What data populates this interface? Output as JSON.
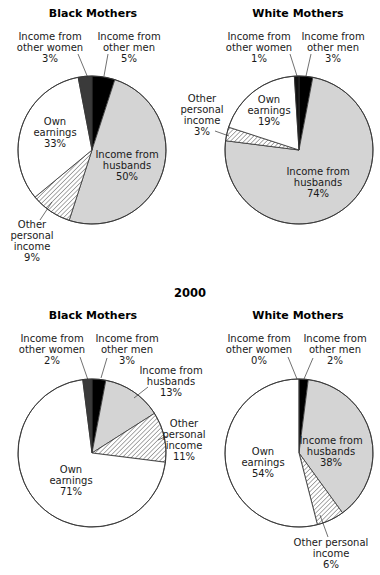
{
  "chart_data": [
    {
      "type": "pie",
      "group": "",
      "title": "Black Mothers",
      "slices": [
        {
          "label": "Income from other men",
          "value": 5,
          "display": "5%",
          "fill": "#000000"
        },
        {
          "label": "Income from husbands",
          "value": 50,
          "display": "50%",
          "fill": "#d4d4d4"
        },
        {
          "label": "Other personal income",
          "value": 9,
          "display": "9%",
          "fill": "hatch"
        },
        {
          "label": "Own earnings",
          "value": 33,
          "display": "33%",
          "fill": "#ffffff"
        },
        {
          "label": "Income from other women",
          "value": 3,
          "display": "3%",
          "fill": "#3a3a3a"
        }
      ]
    },
    {
      "type": "pie",
      "group": "",
      "title": "White Mothers",
      "slices": [
        {
          "label": "Income from other men",
          "value": 3,
          "display": "3%",
          "fill": "#000000"
        },
        {
          "label": "Income from husbands",
          "value": 74,
          "display": "74%",
          "fill": "#d4d4d4"
        },
        {
          "label": "Other personal income",
          "value": 3,
          "display": "3%",
          "fill": "hatch"
        },
        {
          "label": "Own earnings",
          "value": 19,
          "display": "19%",
          "fill": "#ffffff"
        },
        {
          "label": "Income from other women",
          "value": 1,
          "display": "1%",
          "fill": "#111111"
        }
      ]
    },
    {
      "type": "pie",
      "group": "2000",
      "title": "Black Mothers",
      "slices": [
        {
          "label": "Income from other men",
          "value": 3,
          "display": "3%",
          "fill": "#000000"
        },
        {
          "label": "Income from husbands",
          "value": 13,
          "display": "13%",
          "fill": "#d4d4d4"
        },
        {
          "label": "Other personal income",
          "value": 11,
          "display": "11%",
          "fill": "hatch"
        },
        {
          "label": "Own earnings",
          "value": 71,
          "display": "71%",
          "fill": "#ffffff"
        },
        {
          "label": "Income from other women",
          "value": 2,
          "display": "2%",
          "fill": "#3a3a3a"
        }
      ]
    },
    {
      "type": "pie",
      "group": "2000",
      "title": "White Mothers",
      "slices": [
        {
          "label": "Income from other men",
          "value": 2,
          "display": "2%",
          "fill": "#000000"
        },
        {
          "label": "Income from husbands",
          "value": 38,
          "display": "38%",
          "fill": "#d4d4d4"
        },
        {
          "label": "Other personal income",
          "value": 6,
          "display": "6%",
          "fill": "hatch"
        },
        {
          "label": "Own earnings",
          "value": 54,
          "display": "54%",
          "fill": "#ffffff"
        },
        {
          "label": "Income from other women",
          "value": 0,
          "display": "0%",
          "fill": "#3a3a3a"
        }
      ]
    }
  ],
  "section_heading": "2000",
  "labels": {
    "p0": {
      "title": "Black Mothers",
      "women": [
        "Income from",
        "other women",
        "3%"
      ],
      "men": [
        "Income from",
        "other men",
        "5%"
      ],
      "own": [
        "Own",
        "earnings",
        "33%"
      ],
      "husbands": [
        "Income from",
        "husbands",
        "50%"
      ],
      "other": [
        "Other",
        "personal",
        "income",
        "9%"
      ]
    },
    "p1": {
      "title": "White Mothers",
      "women": [
        "Income from",
        "other women",
        "1%"
      ],
      "men": [
        "Income from",
        "other men",
        "3%"
      ],
      "own": [
        "Own",
        "earnings",
        "19%"
      ],
      "husbands": [
        "Income from",
        "husbands",
        "74%"
      ],
      "other": [
        "Other",
        "personal",
        "income",
        "3%"
      ]
    },
    "p2": {
      "title": "Black Mothers",
      "women": [
        "Income from",
        "other women",
        "2%"
      ],
      "men": [
        "Income from",
        "other men",
        "3%"
      ],
      "own": [
        "Own",
        "earnings",
        "71%"
      ],
      "husbands": [
        "Income from",
        "husbands",
        "13%"
      ],
      "other": [
        "Other",
        "personal",
        "income",
        "11%"
      ]
    },
    "p3": {
      "title": "White Mothers",
      "women": [
        "Income from",
        "other women",
        "0%"
      ],
      "men": [
        "Income from",
        "other men",
        "2%"
      ],
      "own": [
        "Own",
        "earnings",
        "54%"
      ],
      "husbands": [
        "Income from",
        "husbands",
        "38%"
      ],
      "other": [
        "Other personal",
        "income",
        "6%"
      ]
    }
  }
}
